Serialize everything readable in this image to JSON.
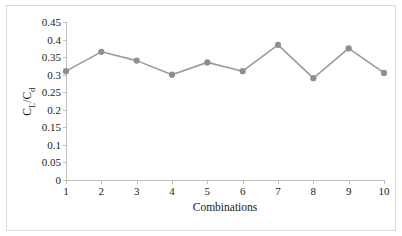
{
  "chart_data": {
    "type": "line",
    "title": "",
    "subtitle": "",
    "xlabel": "Combinations",
    "ylabel": "CL/Cd",
    "ylabel_parts": {
      "lead": "C",
      "lead_sub": "L",
      "mid": "/C",
      "tail_sub": "d"
    },
    "categories": [
      "1",
      "2",
      "3",
      "4",
      "5",
      "6",
      "7",
      "8",
      "9",
      "10"
    ],
    "x": [
      1,
      2,
      3,
      4,
      5,
      6,
      7,
      8,
      9,
      10
    ],
    "values": [
      0.31,
      0.365,
      0.34,
      0.3,
      0.335,
      0.31,
      0.385,
      0.29,
      0.375,
      0.305
    ],
    "series": [
      {
        "name": "CL/Cd",
        "values": [
          0.31,
          0.365,
          0.34,
          0.3,
          0.335,
          0.31,
          0.385,
          0.29,
          0.375,
          0.305
        ]
      }
    ],
    "ylim": [
      0,
      0.45
    ],
    "xlim": [
      1,
      10
    ],
    "y_ticks": [
      0,
      0.05,
      0.1,
      0.15,
      0.2,
      0.25,
      0.3,
      0.35,
      0.4,
      0.45
    ],
    "y_tick_labels": [
      "0",
      "0.05",
      "0.1",
      "0.15",
      "0.2",
      "0.25",
      "0.3",
      "0.35",
      "0.4",
      "0.45"
    ],
    "x_tick_labels": [
      "1",
      "2",
      "3",
      "4",
      "5",
      "6",
      "7",
      "8",
      "9",
      "10"
    ],
    "grid": false,
    "legend": false,
    "legend_position": "none",
    "marker": "circle",
    "colors": {
      "series_line": "#9b9b9b",
      "marker_fill": "#8e8e8e",
      "axis": "#bfbfbf",
      "text": "#1a1a1a",
      "frame": "#d9d9d9",
      "background": "#ffffff"
    }
  }
}
